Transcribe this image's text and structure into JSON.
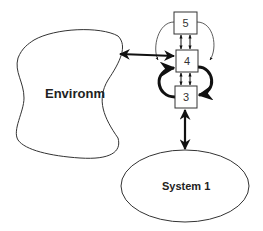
{
  "diagram": {
    "nodes": [
      {
        "id": "environment",
        "label": "Environm",
        "shape": "blob"
      },
      {
        "id": "system1",
        "label": "System 1",
        "shape": "ellipse"
      },
      {
        "id": "box5",
        "label": "5",
        "shape": "rect"
      },
      {
        "id": "box4",
        "label": "4",
        "shape": "rect"
      },
      {
        "id": "box3",
        "label": "3",
        "shape": "rect"
      }
    ],
    "edges": [
      {
        "from": "environment",
        "to": "box4",
        "type": "bidirectional"
      },
      {
        "from": "box3",
        "to": "system1",
        "type": "bidirectional"
      },
      {
        "from": "box5",
        "to": "box4",
        "type": "bidirectional-pair"
      },
      {
        "from": "box4",
        "to": "box3",
        "type": "bidirectional-pair"
      },
      {
        "from": "box5",
        "to": "box4",
        "type": "curved-loop"
      },
      {
        "from": "box4",
        "to": "box3",
        "type": "curved-loop-bold"
      },
      {
        "from": "box3",
        "to": "box4",
        "type": "curved-loop-bold"
      }
    ],
    "colors": {
      "stroke": "#333333",
      "background": "#ffffff"
    }
  }
}
